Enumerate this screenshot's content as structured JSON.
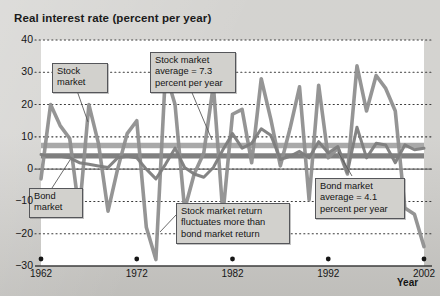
{
  "chart_data": {
    "type": "line",
    "title": "Real interest rate (percent per year)",
    "xlabel": "Year",
    "ylabel": "Real interest rate (percent per year)",
    "xlim": [
      1962,
      2002
    ],
    "ylim": [
      -30,
      40
    ],
    "grid": true,
    "grid_style": "dotted-horizontal",
    "legend": "inline-callouts",
    "y_ticks": [
      "40",
      "30",
      "20",
      "10",
      "0",
      "-10",
      "-20",
      "-30"
    ],
    "y_tick_values": [
      40,
      30,
      20,
      10,
      0,
      -10,
      -20,
      -30
    ],
    "x_ticks": [
      "1962",
      "1972",
      "1982",
      "1992",
      "2002"
    ],
    "x_tick_values": [
      1962,
      1972,
      1982,
      1992,
      2002
    ],
    "series": [
      {
        "name": "Stock market",
        "color": "#8f8f8f",
        "x": [
          1962,
          1963,
          1964,
          1965,
          1966,
          1967,
          1968,
          1969,
          1970,
          1971,
          1972,
          1973,
          1974,
          1975,
          1976,
          1977,
          1978,
          1979,
          1980,
          1981,
          1982,
          1983,
          1984,
          1985,
          1986,
          1987,
          1988,
          1989,
          1990,
          1991,
          1992,
          1993,
          1994,
          1995,
          1996,
          1997,
          1998,
          1999,
          2000,
          2001,
          2002
        ],
        "values": [
          -3.0,
          20.0,
          13.5,
          9.5,
          -13.5,
          20.0,
          8.0,
          -13.0,
          0.0,
          11.0,
          15.0,
          -18.0,
          -28.0,
          30.0,
          20.0,
          -12.5,
          -1.5,
          5.0,
          26.0,
          -14.0,
          17.0,
          18.5,
          2.0,
          28.0,
          15.5,
          1.0,
          12.5,
          25.5,
          -9.5,
          26.0,
          3.5,
          6.5,
          -1.5,
          32.0,
          18.0,
          29.0,
          25.0,
          18.0,
          -12.0,
          -14.0,
          -24.0
        ]
      },
      {
        "name": "Bond market",
        "color": "#7d7d7d",
        "x": [
          1962,
          1963,
          1964,
          1965,
          1966,
          1967,
          1968,
          1969,
          1970,
          1971,
          1972,
          1973,
          1974,
          1975,
          1976,
          1977,
          1978,
          1979,
          1980,
          1981,
          1982,
          1983,
          1984,
          1985,
          1986,
          1987,
          1988,
          1989,
          1990,
          1991,
          1992,
          1993,
          1994,
          1995,
          1996,
          1997,
          1998,
          1999,
          2000,
          2001,
          2002
        ],
        "values": [
          4.5,
          4.0,
          4.0,
          3.5,
          2.0,
          1.5,
          1.0,
          0.5,
          3.5,
          4.0,
          3.5,
          0.0,
          -3.0,
          1.5,
          6.5,
          0.5,
          -1.5,
          -2.5,
          0.5,
          6.0,
          11.0,
          6.5,
          8.0,
          12.5,
          10.5,
          3.0,
          4.0,
          5.5,
          3.5,
          8.5,
          5.0,
          7.0,
          -1.0,
          13.0,
          3.5,
          8.0,
          7.5,
          2.0,
          7.5,
          6.0,
          6.5
        ]
      },
      {
        "name": "Stock market average",
        "type": "reference-band",
        "color": "#9e9e9e",
        "value": 7.3
      },
      {
        "name": "Bond market average",
        "type": "reference-band",
        "color": "#6f6f6f",
        "value": 4.1
      }
    ],
    "annotations": [
      {
        "id": "stock-market",
        "text": "Stock\nmarket",
        "target_year": 1964,
        "target_value": 20
      },
      {
        "id": "stock-average",
        "text": "Stock market\naverage = 7.3\npercent per year",
        "target_value": 7.3
      },
      {
        "id": "bond-market",
        "text": "Bond\nmarket",
        "target_year": 1964,
        "target_value": 4.0
      },
      {
        "id": "fluctuation",
        "text": "Stock market return\nfluctuates more than\nbond market return",
        "target_year": 1974,
        "target_value": -28
      },
      {
        "id": "bond-average",
        "text": "Bond market\naverage = 4.1\npercent per year",
        "target_value": 4.1
      }
    ],
    "colors": {
      "figure_background": "#cfcecb",
      "plot_background": "#ffffff",
      "gridline": "#3a3a3a",
      "axis": "#6d6d6d",
      "text": "#161616",
      "callout_background": "#d2d1cd",
      "callout_border": "#55565a"
    }
  }
}
